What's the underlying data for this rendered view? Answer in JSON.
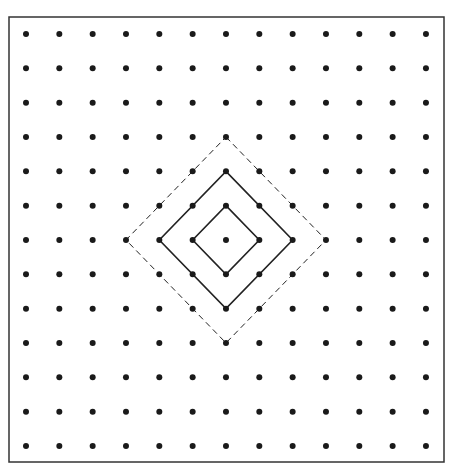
{
  "diagram": {
    "type": "dot-grid-with-nested-diamonds",
    "grid": {
      "columns": 13,
      "rows": 13,
      "x0": 26,
      "y0": 34,
      "dx": 33.33,
      "dy": 34.33,
      "dot_radius": 3
    },
    "frame": {
      "x": 9,
      "y": 17,
      "width": 435,
      "height": 445
    },
    "center": {
      "col": 6,
      "row": 6
    },
    "diamonds": [
      {
        "radius": 1,
        "style": "solid"
      },
      {
        "radius": 2,
        "style": "solid"
      },
      {
        "radius": 3,
        "style": "dashed"
      }
    ],
    "colors": {
      "dot": "#1a1a1a",
      "line": "#222222",
      "frame": "#333333"
    }
  }
}
